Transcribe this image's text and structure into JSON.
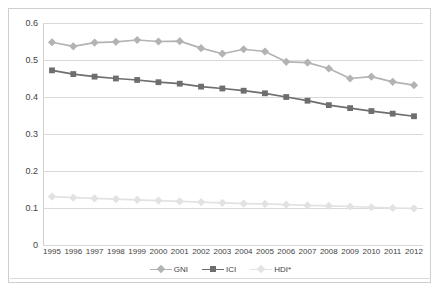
{
  "caption": {
    "text": "· ·",
    "name": "cut-off-caption"
  },
  "chart_data": {
    "type": "line",
    "title": "",
    "subtitle": "",
    "xlabel": "",
    "ylabel": "",
    "categories": [
      "1995",
      "1996",
      "1997",
      "1998",
      "1999",
      "2000",
      "2001",
      "2002",
      "2003",
      "2004",
      "2005",
      "2006",
      "2007",
      "2008",
      "2009",
      "2010",
      "2011",
      "2012"
    ],
    "ylim": [
      0,
      0.6
    ],
    "ytick_labels": [
      "0",
      "0.1",
      "0.2",
      "0.3",
      "0.4",
      "0.5",
      "0.6"
    ],
    "ytick_values": [
      0,
      0.1,
      0.2,
      0.3,
      0.4,
      0.5,
      0.6
    ],
    "grid": true,
    "legend_position": "bottom",
    "series": [
      {
        "name": "GNI",
        "color": "#b3b3b3",
        "marker": "diamond",
        "values": [
          0.548,
          0.537,
          0.547,
          0.549,
          0.554,
          0.55,
          0.551,
          0.532,
          0.517,
          0.529,
          0.523,
          0.495,
          0.493,
          0.477,
          0.45,
          0.455,
          0.441,
          0.432
        ]
      },
      {
        "name": "ICI",
        "color": "#6e6e6e",
        "marker": "square",
        "values": [
          0.472,
          0.462,
          0.455,
          0.45,
          0.446,
          0.44,
          0.436,
          0.428,
          0.423,
          0.417,
          0.41,
          0.4,
          0.39,
          0.378,
          0.37,
          0.362,
          0.355,
          0.348
        ]
      },
      {
        "name": "HDI*",
        "color": "#e2e2e2",
        "marker": "diamond",
        "values": [
          0.131,
          0.128,
          0.126,
          0.124,
          0.122,
          0.12,
          0.118,
          0.116,
          0.114,
          0.112,
          0.111,
          0.109,
          0.107,
          0.106,
          0.104,
          0.102,
          0.1,
          0.099
        ]
      }
    ]
  },
  "legend": {
    "entries": [
      {
        "label": "GNI",
        "color": "#b3b3b3",
        "marker": "diamond"
      },
      {
        "label": "ICI",
        "color": "#6e6e6e",
        "marker": "square"
      },
      {
        "label": "HDI*",
        "color": "#e2e2e2",
        "marker": "diamond"
      }
    ]
  },
  "colors": {
    "frame_border": "#cfcfcf",
    "gridline": "#d9d9d9",
    "text": "#3f3f3f",
    "background": "#ffffff"
  }
}
